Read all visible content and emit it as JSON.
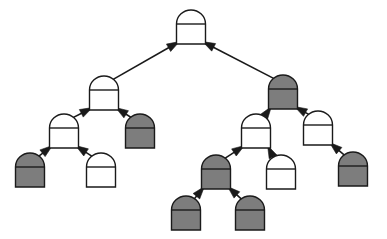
{
  "diagram": {
    "type": "tree-diagram",
    "width": 387,
    "height": 239,
    "background_color": "#ffffff",
    "node_shape": "dome-top rectangle (semicircular cap over rectangular body) with horizontal divider line",
    "edge_style": "straight line with solid triangular arrowhead pointing from child to parent",
    "colors": {
      "node_fill_light": "#ffffff",
      "node_fill_dark": "#7d7d7d",
      "node_stroke": "#1a1a1a",
      "edge_stroke": "#1a1a1a",
      "arrowhead_fill": "#1a1a1a"
    },
    "geometry": {
      "node_width": 29,
      "node_body_height": 20,
      "node_dome_height": 14,
      "stroke_width": 1.4,
      "edge_stroke_width": 1.6
    },
    "legend": {
      "light_meaning": "unshaded node",
      "dark_meaning": "shaded node"
    }
  },
  "nodes": [
    {
      "id": "n0",
      "name": "root",
      "cx": 191,
      "cy": 27,
      "fill": "light",
      "depth": 0
    },
    {
      "id": "n1",
      "name": "root-left",
      "cx": 104,
      "cy": 93,
      "fill": "light",
      "depth": 1
    },
    {
      "id": "n2",
      "name": "root-right",
      "cx": 283,
      "cy": 92,
      "fill": "dark",
      "depth": 1
    },
    {
      "id": "n3",
      "name": "root-left-left",
      "cx": 64,
      "cy": 131,
      "fill": "light",
      "depth": 2
    },
    {
      "id": "n4",
      "name": "root-left-right",
      "cx": 140,
      "cy": 131,
      "fill": "dark",
      "depth": 2
    },
    {
      "id": "n5",
      "name": "root-right-left",
      "cx": 256,
      "cy": 131,
      "fill": "light",
      "depth": 2
    },
    {
      "id": "n6",
      "name": "root-right-right",
      "cx": 318,
      "cy": 128,
      "fill": "light",
      "depth": 2
    },
    {
      "id": "n7",
      "name": "root-left-left-left",
      "cx": 30,
      "cy": 170,
      "fill": "dark",
      "depth": 3
    },
    {
      "id": "n8",
      "name": "root-left-left-right",
      "cx": 101,
      "cy": 170,
      "fill": "light",
      "depth": 3
    },
    {
      "id": "n9",
      "name": "root-right-left-left",
      "cx": 216,
      "cy": 172,
      "fill": "dark",
      "depth": 3
    },
    {
      "id": "n10",
      "name": "root-right-left-right",
      "cx": 281,
      "cy": 172,
      "fill": "light",
      "depth": 3
    },
    {
      "id": "n11",
      "name": "root-right-right-right",
      "cx": 353,
      "cy": 169,
      "fill": "dark",
      "depth": 3
    },
    {
      "id": "n12",
      "name": "deep-left-leaf",
      "cx": 186,
      "cy": 213,
      "fill": "dark",
      "depth": 4
    },
    {
      "id": "n13",
      "name": "deep-right-leaf",
      "cx": 250,
      "cy": 213,
      "fill": "dark",
      "depth": 4
    }
  ],
  "edges": [
    {
      "from": "n1",
      "to": "n0",
      "label": "root-left-to-root"
    },
    {
      "from": "n2",
      "to": "n0",
      "label": "root-right-to-root"
    },
    {
      "from": "n3",
      "to": "n1",
      "label": "left-left-to-left"
    },
    {
      "from": "n4",
      "to": "n1",
      "label": "left-right-to-left"
    },
    {
      "from": "n5",
      "to": "n2",
      "label": "right-left-to-right"
    },
    {
      "from": "n6",
      "to": "n2",
      "label": "right-right-to-right"
    },
    {
      "from": "n7",
      "to": "n3",
      "label": "lll-to-ll"
    },
    {
      "from": "n8",
      "to": "n3",
      "label": "llr-to-ll"
    },
    {
      "from": "n9",
      "to": "n5",
      "label": "rll-to-rl"
    },
    {
      "from": "n10",
      "to": "n5",
      "label": "rlr-to-rl"
    },
    {
      "from": "n11",
      "to": "n6",
      "label": "rrr-to-rr"
    },
    {
      "from": "n12",
      "to": "n9",
      "label": "deep-left-to-rll"
    },
    {
      "from": "n13",
      "to": "n9",
      "label": "deep-right-to-rll"
    }
  ]
}
